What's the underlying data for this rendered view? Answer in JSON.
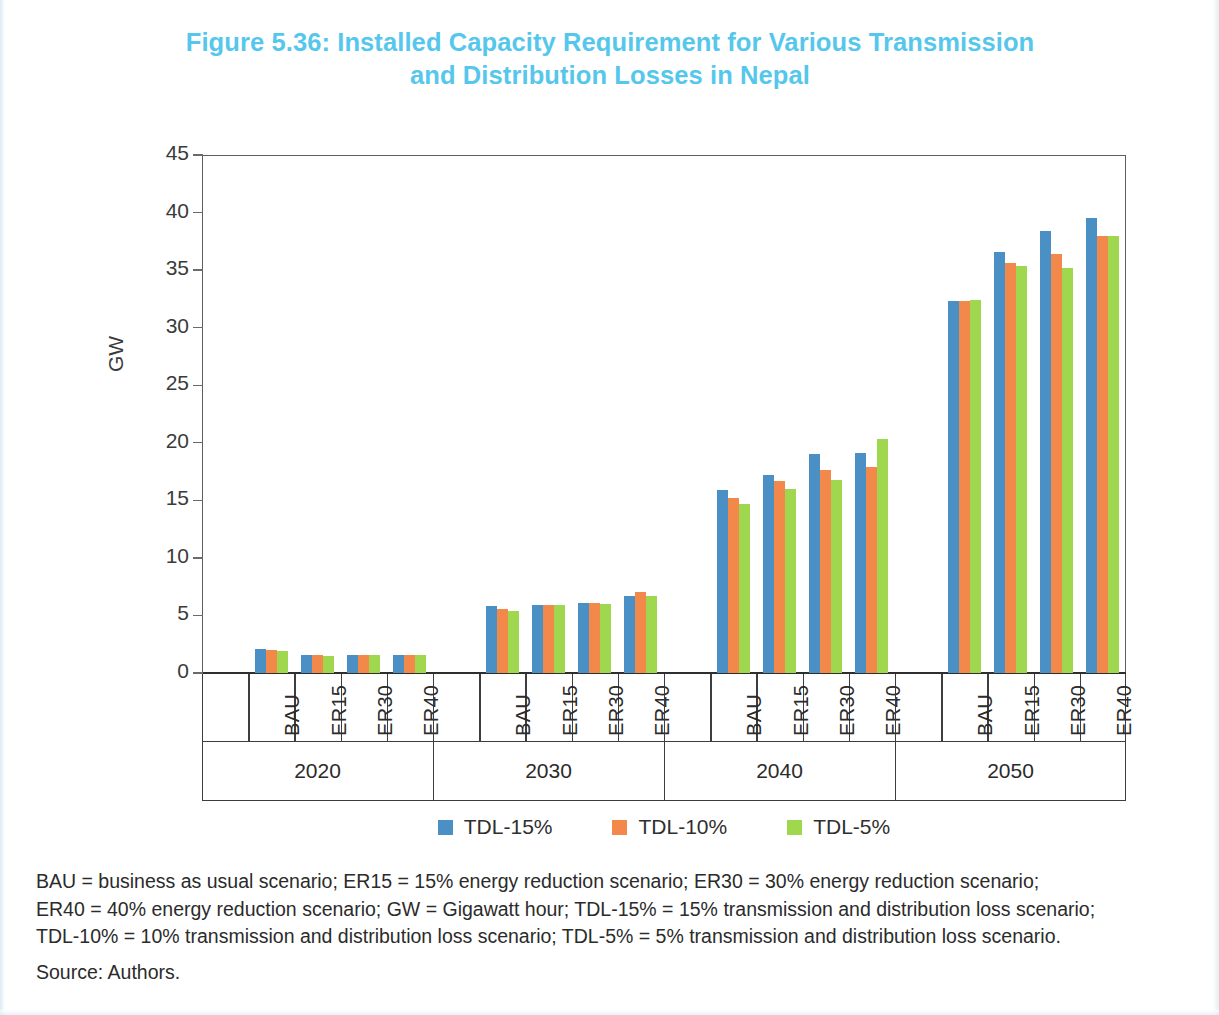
{
  "figure": {
    "title": "Figure 5.36: Installed Capacity Requirement for Various Transmission and Distribution Losses in Nepal",
    "title_line1": "Figure 5.36: Installed Capacity Requirement for Various Transmission",
    "title_line2": "and Distribution Losses in Nepal",
    "title_color": "#56c7ec"
  },
  "notes": {
    "line1": "BAU = business as usual scenario; ER15 = 15% energy reduction scenario; ER30 = 30% energy reduction scenario;",
    "line2": "ER40 = 40% energy reduction scenario; GW = Gigawatt hour; TDL-15% = 15% transmission and distribution loss scenario;",
    "line3": "TDL-10% = 10% transmission and distribution loss scenario; TDL-5% = 5% transmission and distribution loss scenario.",
    "source": "Source: Authors."
  },
  "chart_data": {
    "type": "bar",
    "title": "Figure 5.36: Installed Capacity Requirement for Various Transmission and Distribution Losses in Nepal",
    "xlabel": "",
    "ylabel": "GW",
    "ylim": [
      0,
      45
    ],
    "yticks": [
      0,
      5,
      10,
      15,
      20,
      25,
      30,
      35,
      40,
      45
    ],
    "ytick_labels": [
      "0",
      "5",
      "10",
      "15",
      "20",
      "25",
      "30",
      "35",
      "40",
      "45"
    ],
    "grid": false,
    "legend_position": "bottom",
    "group_labels": [
      "2020",
      "2030",
      "2040",
      "2050"
    ],
    "subgroup_labels": [
      "BAU",
      "ER15",
      "ER30",
      "ER40"
    ],
    "categories": [
      "2020 BAU",
      "2020 ER15",
      "2020 ER30",
      "2020 ER40",
      "2030 BAU",
      "2030 ER15",
      "2030 ER30",
      "2030 ER40",
      "2040 BAU",
      "2040 ER15",
      "2040 ER30",
      "2040 ER40",
      "2050 BAU",
      "2050 ER15",
      "2050 ER30",
      "2050 ER40"
    ],
    "series": [
      {
        "name": "TDL-15%",
        "color": "#4b90c4",
        "values": [
          2.1,
          1.6,
          1.6,
          1.6,
          5.8,
          5.9,
          6.1,
          6.7,
          15.9,
          17.2,
          19.0,
          19.1,
          32.3,
          36.6,
          38.4,
          39.5
        ]
      },
      {
        "name": "TDL-10%",
        "color": "#f2894a",
        "values": [
          2.0,
          1.6,
          1.6,
          1.6,
          5.6,
          5.9,
          6.1,
          7.0,
          15.2,
          16.7,
          17.6,
          17.9,
          32.3,
          35.6,
          36.4,
          38.0
        ]
      },
      {
        "name": "TDL-5%",
        "color": "#9fd74e",
        "values": [
          1.9,
          1.5,
          1.6,
          1.6,
          5.4,
          5.9,
          6.0,
          6.7,
          14.7,
          16.0,
          16.8,
          20.3,
          32.4,
          35.4,
          35.2,
          38.0
        ]
      }
    ]
  },
  "legend": [
    {
      "label": "TDL-15%",
      "color": "#4b90c4"
    },
    {
      "label": "TDL-10%",
      "color": "#f2894a"
    },
    {
      "label": "TDL-5%",
      "color": "#9fd74e"
    }
  ]
}
